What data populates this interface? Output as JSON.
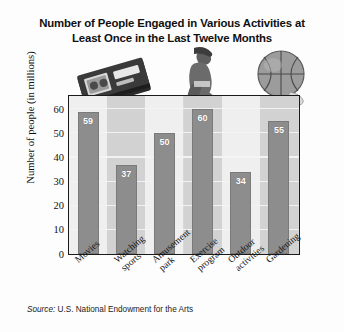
{
  "chart_data": {
    "type": "bar",
    "title": "Number of People Engaged in Various Activities at Least Once in the Last Twelve Months",
    "title_line1": "Number of People Engaged in Various Activities at",
    "title_line2": "Least Once in the Last Twelve Months",
    "categories": [
      "Movies",
      "Watching sports",
      "Amusement park",
      "Exercise program",
      "Outdoor activities",
      "Gardening"
    ],
    "category_lines": [
      [
        "Movies"
      ],
      [
        "Watching",
        "sports"
      ],
      [
        "Amusement",
        "park"
      ],
      [
        "Exercise",
        "program"
      ],
      [
        "Outdoor",
        "activities"
      ],
      [
        "Gardening"
      ]
    ],
    "values": [
      59,
      37,
      50,
      60,
      34,
      55
    ],
    "xlabel": "",
    "ylabel": "Number of people (in millions)",
    "ylim": [
      0,
      65
    ],
    "yticks": [
      0,
      10,
      20,
      30,
      40,
      50,
      60
    ],
    "ytick_labels": [
      "0",
      "10",
      "20",
      "30",
      "40",
      "50",
      "60"
    ],
    "grid": true,
    "grid_orientation": "horizontal",
    "legend": null,
    "bar_color": "#8d8d8d",
    "value_label_color": "#ffffff",
    "plot_background": "#d8d8d8",
    "band_light": "#efefef",
    "band_dark": "#d2d2d2",
    "frame_color": "#1a1a1a"
  },
  "source": {
    "prefix": "Source:",
    "text": " U.S. National Endowment for the Arts"
  },
  "artwork": [
    {
      "name": "vhs-tape-image",
      "label": "VHS video cassette tape"
    },
    {
      "name": "person-stretching-image",
      "label": "Person seated stretching"
    },
    {
      "name": "basketball-image",
      "label": "Basketball"
    }
  ]
}
